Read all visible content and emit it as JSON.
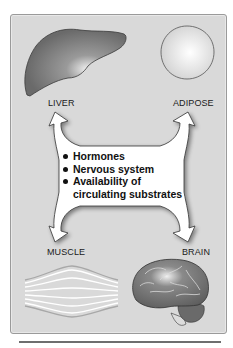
{
  "diagram": {
    "tissues": {
      "liver": {
        "label": "LIVER",
        "icon": "liver-icon"
      },
      "adipose": {
        "label": "ADIPOSE",
        "icon": "adipose-cell-icon"
      },
      "muscle": {
        "label": "MUSCLE",
        "icon": "muscle-fiber-icon"
      },
      "brain": {
        "label": "BRAIN",
        "icon": "brain-icon"
      }
    },
    "regulating_factors": {
      "items": [
        {
          "text": "Hormones"
        },
        {
          "text": "Nervous system"
        },
        {
          "text": "Availability of",
          "continuation": "circulating substrates"
        }
      ]
    },
    "colors": {
      "panel_background": "#d9d9d9",
      "arrow_fill": "#ffffff",
      "organ_fill": "#707070",
      "text": "#111111"
    }
  }
}
